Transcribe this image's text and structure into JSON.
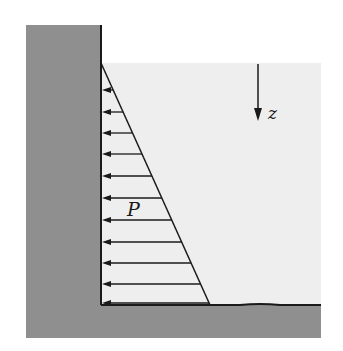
{
  "figure": {
    "labels": {
      "pressure": "P",
      "depth_axis": "z"
    },
    "colors": {
      "wall": "#8f8f8f",
      "ground": "#8f8f8f",
      "water": "#eeeeee",
      "line": "#1a1a1a",
      "background": "#ffffff"
    },
    "geometry": {
      "wall": {
        "x": 26,
        "y": 25,
        "width": 75,
        "height": 313
      },
      "ground": {
        "x": 26,
        "y": 305,
        "width": 295,
        "height": 33
      },
      "water": {
        "x": 101,
        "y": 63,
        "width": 220,
        "height": 242
      },
      "triangle": {
        "top": [
          101,
          63
        ],
        "bottom_wall": [
          101,
          305
        ],
        "bottom_tip": [
          210,
          305
        ]
      },
      "arrow_rows_y": [
        90,
        112,
        133,
        154,
        176,
        198,
        220,
        242,
        263,
        284,
        303
      ],
      "z_arrow": {
        "x": 258,
        "y1": 64,
        "y2": 120
      }
    }
  }
}
